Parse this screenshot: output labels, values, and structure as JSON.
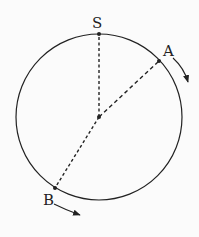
{
  "diagram": {
    "type": "circular-track",
    "circle": {
      "cx": 99,
      "cy": 117,
      "r": 83
    },
    "center": {
      "x": 99,
      "y": 117
    },
    "points": [
      {
        "id": "S",
        "label": "S",
        "x": 99,
        "y": 34,
        "label_x": 92,
        "label_y": 28
      },
      {
        "id": "A",
        "label": "A",
        "x": 159,
        "y": 61,
        "label_x": 163,
        "label_y": 56
      },
      {
        "id": "B",
        "label": "B",
        "x": 55,
        "y": 188,
        "label_x": 43,
        "label_y": 205
      }
    ],
    "radii": [
      {
        "to": "S",
        "style": "dashed"
      },
      {
        "to": "A",
        "style": "dashed"
      },
      {
        "to": "B",
        "style": "dashed"
      }
    ],
    "arrows": [
      {
        "near": "A",
        "direction": "clockwise"
      },
      {
        "near": "B",
        "direction": "counterclockwise-along-track"
      }
    ],
    "colors": {
      "stroke": "#222222",
      "background": "#fbfbfb"
    }
  }
}
